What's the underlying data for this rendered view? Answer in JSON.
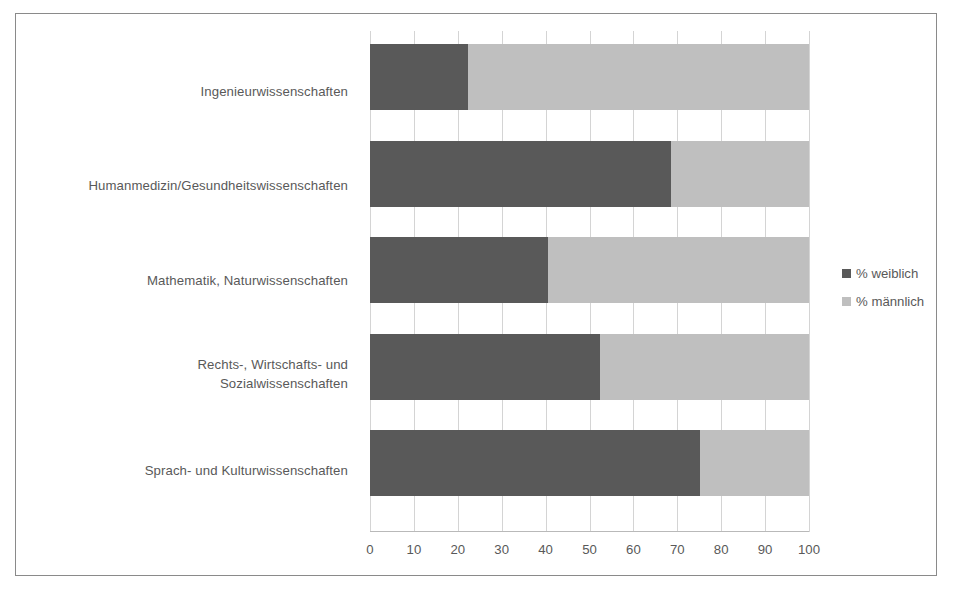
{
  "chart_data": {
    "type": "bar",
    "subtype": "stacked-horizontal-100-percent",
    "title": "",
    "xlabel": "",
    "ylabel": "",
    "xlim": [
      0,
      100
    ],
    "xticks": [
      "0",
      "10",
      "20",
      "30",
      "40",
      "50",
      "60",
      "70",
      "80",
      "90",
      "100"
    ],
    "grid": true,
    "legend_position": "right",
    "categories": [
      "Ingenieurwissenschaften",
      "Humanmedizin/Gesundheitswissenschaften",
      "Mathematik, Naturwissenschaften",
      "Rechts-, Wirtschafts- und Sozialwissenschaften",
      "Sprach- und Kulturwissenschaften"
    ],
    "series": [
      {
        "name": "% weiblich",
        "color": "#595959",
        "values": [
          22.3,
          68.6,
          40.5,
          52.4,
          75.2
        ]
      },
      {
        "name": "% männlich",
        "color": "#bfbfbf",
        "values": [
          77.7,
          31.4,
          59.5,
          47.6,
          24.8
        ]
      }
    ]
  },
  "labels": {
    "cat0_line1": "Ingenieurwissenschaften",
    "cat1_line1": "Humanmedizin/Gesundheitswissenschaften",
    "cat2_line1": "Mathematik, Naturwissenschaften",
    "cat3_line1": "Rechts-, Wirtschafts- und",
    "cat3_line2": "Sozialwissenschaften",
    "cat4_line1": "Sprach- und Kulturwissenschaften"
  },
  "legend": {
    "items": [
      {
        "label": "% weiblich",
        "color": "#595959"
      },
      {
        "label": "% männlich",
        "color": "#bfbfbf"
      }
    ]
  }
}
